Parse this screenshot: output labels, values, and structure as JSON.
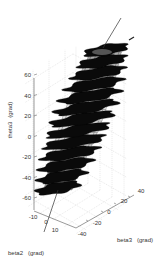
{
  "chart_data": {
    "type": "surface3d",
    "title": "",
    "axes": {
      "z": {
        "label": "theta3",
        "unit": "(grad)",
        "ticks": [
          -60,
          -40,
          -20,
          0,
          20,
          40,
          60
        ],
        "range": [
          -70,
          70
        ]
      },
      "x": {
        "label": "beta2",
        "unit": "(grad)",
        "ticks": [
          -10,
          0,
          10
        ],
        "range": [
          -15,
          15
        ]
      },
      "y": {
        "label": "beta3",
        "unit": "(grad)",
        "ticks": [
          -40,
          -20,
          0,
          20,
          40
        ],
        "range": [
          -45,
          45
        ]
      }
    },
    "grid": true,
    "colormap": "gray",
    "surface": {
      "description": "stacked wavy discs along tilted spine (helical surface)",
      "layers": 13,
      "spine_start": {
        "beta2": 0,
        "beta3": -30,
        "theta3": -65
      },
      "spine_end": {
        "beta2": 0,
        "beta3": 30,
        "theta3": 70
      }
    }
  },
  "labels": {
    "zlabel": "theta3",
    "zunit": "(grad)",
    "xlabel": "beta2",
    "xunit": "(grad)",
    "ylabel": "beta3",
    "yunit": "(grad)"
  }
}
